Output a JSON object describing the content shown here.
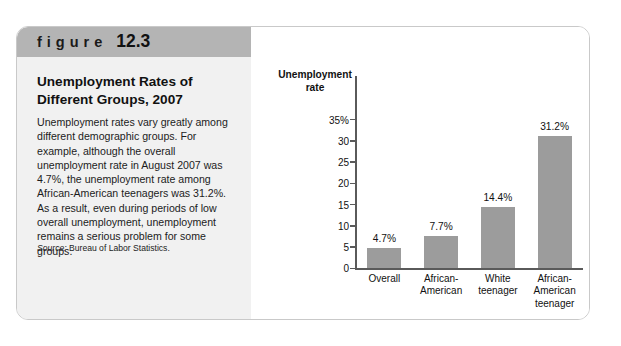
{
  "figure": {
    "banner_word": "figure",
    "banner_number": "12.3",
    "title_line1": "Unemployment Rates of",
    "title_line2": "Different Groups, 2007",
    "body": "Unemployment rates vary greatly among different demographic groups. For example, although the overall unemployment rate in August 2007 was 4.7%, the unemployment rate among African-American teenagers was 31.2%. As a result, even during periods of low overall unemployment, unemployment remains a serious problem for some groups.",
    "source_label": "Source:",
    "source_text": "Bureau of Labor Statistics."
  },
  "colors": {
    "banner": "#b4b4b4",
    "panel": "#f1f1f1",
    "bar": "#9c9c9c",
    "axis": "#5a5a5a",
    "text": "#111111"
  },
  "chart_data": {
    "type": "bar",
    "title": "",
    "xlabel": "",
    "ylabel": "Unemployment rate",
    "ylabel_line1": "Unemployment",
    "ylabel_line2": "rate",
    "categories": [
      "Overall",
      "African-American",
      "White teenager",
      "African-American teenager"
    ],
    "category_lines": [
      [
        "Overall"
      ],
      [
        "African-",
        "American"
      ],
      [
        "White",
        "teenager"
      ],
      [
        "African-",
        "American",
        "teenager"
      ]
    ],
    "values": [
      4.7,
      7.7,
      14.4,
      31.2
    ],
    "value_labels": [
      "4.7%",
      "7.7%",
      "14.4%",
      "31.2%"
    ],
    "ylim": [
      0,
      35
    ],
    "yticks": [
      0,
      5,
      10,
      15,
      20,
      25,
      30,
      35
    ],
    "ytick_labels": [
      "0",
      "5",
      "10",
      "15",
      "20",
      "25",
      "30",
      "35%"
    ],
    "grid": false,
    "legend": false
  }
}
